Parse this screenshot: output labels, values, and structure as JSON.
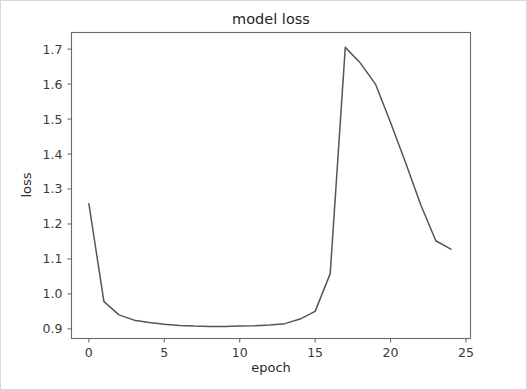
{
  "figure": {
    "background_color": "#ffffff",
    "border_color": "#d8d8d8"
  },
  "chart_data": {
    "type": "line",
    "title": "model loss",
    "xlabel": "epoch",
    "ylabel": "loss",
    "grid": false,
    "legend": null,
    "line_color": "#555555",
    "xlim": [
      -1.15,
      25.3
    ],
    "ylim": [
      0.8725,
      1.7475
    ],
    "xticks": [
      0,
      5,
      10,
      15,
      20,
      25
    ],
    "xtick_labels": [
      "0",
      "5",
      "10",
      "15",
      "20",
      "25"
    ],
    "yticks": [
      0.9,
      1.0,
      1.1,
      1.2,
      1.3,
      1.4,
      1.5,
      1.6,
      1.7
    ],
    "ytick_labels": [
      "0.9",
      "1.0",
      "1.1",
      "1.2",
      "1.3",
      "1.4",
      "1.5",
      "1.6",
      "1.7"
    ],
    "x": [
      0,
      1,
      2,
      3,
      4,
      5,
      6,
      7,
      8,
      9,
      10,
      11,
      12,
      13,
      14,
      15,
      16,
      17,
      18,
      19,
      20,
      21,
      22,
      23,
      24
    ],
    "series": [
      {
        "name": "loss",
        "values": [
          1.258,
          0.978,
          0.94,
          0.925,
          0.918,
          0.913,
          0.91,
          0.908,
          0.907,
          0.907,
          0.908,
          0.909,
          0.911,
          0.915,
          0.928,
          0.95,
          1.058,
          1.705,
          1.66,
          1.6,
          1.49,
          1.375,
          1.255,
          1.152,
          1.128
        ]
      }
    ]
  }
}
